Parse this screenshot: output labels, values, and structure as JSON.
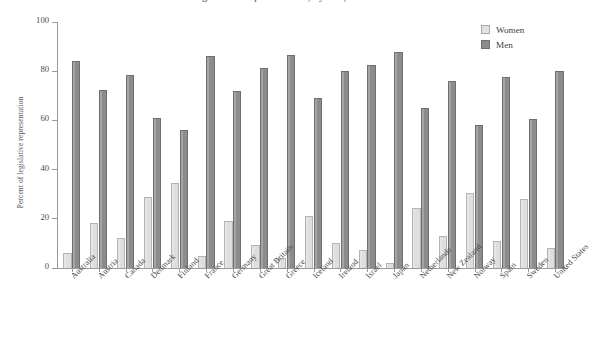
{
  "chart_data": {
    "type": "bar",
    "title": "Percent of Legislative Representation, by Sex, in Selected Countries",
    "xlabel": "",
    "ylabel": "Percent of legislative representation",
    "ylim": [
      0,
      100
    ],
    "yticks": [
      0,
      20,
      40,
      60,
      80,
      100
    ],
    "grid": false,
    "legend_position": "top-right",
    "categories": [
      "Australia",
      "Austria",
      "Canada",
      "Denmark",
      "Finland",
      "France",
      "Germany",
      "Great Britain",
      "Greece",
      "Iceland",
      "Ireland",
      "Israel",
      "Japan",
      "Netherlands",
      "New Zealand",
      "Norway",
      "Spain",
      "Sweden",
      "United States"
    ],
    "series": [
      {
        "name": "Women",
        "color": "#dedede",
        "values": [
          6,
          18.5,
          12,
          29,
          34.5,
          5,
          19,
          9.5,
          4,
          21,
          10,
          7.5,
          2,
          24.5,
          13,
          30.5,
          11,
          28,
          8
        ]
      },
      {
        "name": "Men",
        "color": "#8c8c8c",
        "values": [
          84,
          72.5,
          78.5,
          61,
          56,
          86,
          72,
          81.5,
          86.5,
          69,
          80,
          82.5,
          88,
          65,
          76,
          58,
          77.5,
          60.5,
          80
        ]
      }
    ]
  },
  "legend": {
    "items": [
      {
        "label": "Women"
      },
      {
        "label": "Men"
      }
    ]
  }
}
